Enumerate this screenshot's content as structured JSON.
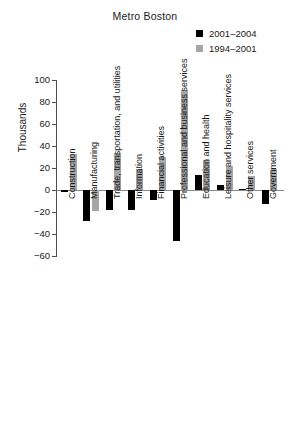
{
  "chart_data": {
    "type": "bar",
    "title": "Metro Boston",
    "xlabel": "",
    "ylabel": "Thousands",
    "ylim": [
      -60,
      100
    ],
    "yticks": [
      100,
      80,
      60,
      40,
      20,
      0,
      -20,
      -40,
      -60
    ],
    "ytick_labels": [
      "100",
      "80",
      "60",
      "40",
      "20",
      "0",
      "−20",
      "−40",
      "−60"
    ],
    "grid": false,
    "legend_position": "top-right",
    "categories": [
      "Construction",
      "Manufacturing",
      "Trade, transportation, and utilities",
      "Information",
      "Financial activities",
      "Professional and business services",
      "Education and health",
      "Leisure and hospitality services",
      "Other services",
      "Government"
    ],
    "series": [
      {
        "name": "2001–2004",
        "color": "#000000",
        "values": [
          -2,
          -28,
          -18,
          -18,
          -9,
          -46,
          14,
          5,
          1,
          -13
        ]
      },
      {
        "name": "1994–2001",
        "color": "#a6a6a6",
        "values": [
          33,
          -19,
          34,
          19,
          30,
          91,
          27,
          22,
          13,
          19
        ]
      }
    ]
  }
}
